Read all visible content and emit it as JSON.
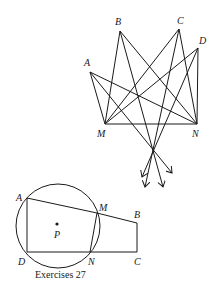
{
  "figure_top": {
    "points": {
      "A": {
        "label": "A",
        "x": 90,
        "y": 72
      },
      "B": {
        "label": "B",
        "x": 120,
        "y": 31
      },
      "C": {
        "label": "C",
        "x": 179,
        "y": 29
      },
      "D": {
        "label": "D",
        "x": 198,
        "y": 48
      },
      "M": {
        "label": "M",
        "x": 105,
        "y": 124
      },
      "N": {
        "label": "N",
        "x": 197,
        "y": 124
      }
    },
    "arrow_origin": {
      "x": 154,
      "y": 149
    }
  },
  "figure_bottom": {
    "circle": {
      "cx": 58,
      "cy": 226,
      "r": 42
    },
    "points": {
      "A": {
        "label": "A"
      },
      "M": {
        "label": "M"
      },
      "B": {
        "label": "B"
      },
      "C": {
        "label": "C"
      },
      "N": {
        "label": "N"
      },
      "D": {
        "label": "D"
      },
      "P": {
        "label": "P"
      }
    },
    "caption": "Exercises 27"
  }
}
